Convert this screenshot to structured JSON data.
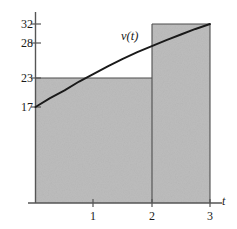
{
  "chart_data": {
    "type": "area",
    "title": "",
    "subtitle": "",
    "xlabel": "t",
    "ylabel": "",
    "xlim": [
      0,
      3.25
    ],
    "ylim": [
      0,
      35
    ],
    "grid": false,
    "legend_position": "none",
    "curve": {
      "name": "v(t)",
      "label": "v(t)",
      "points": [
        {
          "t": 0.0,
          "v": 17.0
        },
        {
          "t": 0.25,
          "v": 18.6
        },
        {
          "t": 0.5,
          "v": 20.0
        },
        {
          "t": 0.75,
          "v": 21.6
        },
        {
          "t": 1.0,
          "v": 23.0
        },
        {
          "t": 1.25,
          "v": 24.4
        },
        {
          "t": 1.5,
          "v": 25.7
        },
        {
          "t": 1.75,
          "v": 26.9
        },
        {
          "t": 2.0,
          "v": 28.0
        },
        {
          "t": 2.25,
          "v": 29.1
        },
        {
          "t": 2.5,
          "v": 30.1
        },
        {
          "t": 2.75,
          "v": 31.1
        },
        {
          "t": 3.0,
          "v": 32.0
        }
      ]
    },
    "shaded_rectangles": [
      {
        "name": "left-rectangle",
        "t_start": 0,
        "t_end": 2,
        "height": 23
      },
      {
        "name": "right-rectangle",
        "t_start": 2,
        "t_end": 3,
        "height": 32
      }
    ],
    "y_ticks": [
      {
        "value": 32,
        "label": "32"
      },
      {
        "value": 28,
        "label": "28"
      },
      {
        "value": 23,
        "label": "23"
      },
      {
        "value": 17,
        "label": "17"
      }
    ],
    "x_ticks": [
      {
        "value": 1,
        "label": "1"
      },
      {
        "value": 2,
        "label": "2"
      },
      {
        "value": 3,
        "label": "3"
      }
    ],
    "colors": {
      "shading": "#bdbdbd",
      "curve": "#1a1a1a",
      "axis": "#555555",
      "rect_outline": "#4d4d4d",
      "text": "#1a1a1a",
      "background": "#ffffff"
    }
  }
}
